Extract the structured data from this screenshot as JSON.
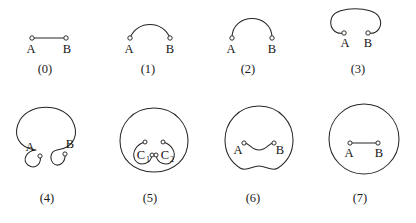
{
  "figure": {
    "background_color": "#ffffff",
    "stroke_color": "#262626",
    "node_fill_color": "#ffffff",
    "description_type": "diagram",
    "rows": 2,
    "columns": 4,
    "panels": [
      {
        "id": "panel-0",
        "caption": "(0)",
        "labels": [
          "A",
          "B"
        ],
        "shape": "straight-segment"
      },
      {
        "id": "panel-1",
        "caption": "(1)",
        "labels": [
          "A",
          "B"
        ],
        "shape": "shallow-arc"
      },
      {
        "id": "panel-2",
        "caption": "(2)",
        "labels": [
          "A",
          "B"
        ],
        "shape": "semicircular-arc"
      },
      {
        "id": "panel-3",
        "caption": "(3)",
        "labels": [
          "A",
          "B"
        ],
        "shape": "overhanging-arc-with-hooks"
      },
      {
        "id": "panel-4",
        "caption": "(4)",
        "labels": [
          "A",
          "B"
        ],
        "shape": "open-circle-with-inward-curls"
      },
      {
        "id": "panel-5",
        "caption": "(5)",
        "labels": [
          "C",
          "C"
        ],
        "label_subscripts": [
          "1",
          "2"
        ],
        "shape": "closed-circle-with-two-inner-curls"
      },
      {
        "id": "panel-6",
        "caption": "(6)",
        "labels": [
          "A",
          "B"
        ],
        "shape": "closed-circle-with-wavy-chord"
      },
      {
        "id": "panel-7",
        "caption": "(7)",
        "labels": [
          "A",
          "B"
        ],
        "shape": "closed-circle-with-straight-chord"
      }
    ]
  }
}
